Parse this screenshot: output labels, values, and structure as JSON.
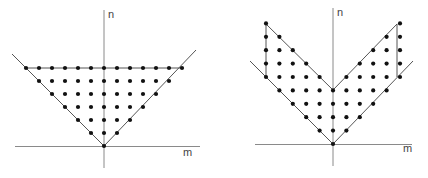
{
  "diagrams": [
    {
      "id": "left",
      "x_label": "m",
      "y_label": "n",
      "description": "lattice points with |m| <= n <= 6",
      "origin": [
        104,
        146
      ],
      "step": 13,
      "axis": {
        "h": [
          15,
          200
        ],
        "v": [
          10,
          168
        ]
      },
      "lines": [
        [
          [
            12,
            54
          ],
          [
            104,
            146
          ]
        ],
        [
          [
            104,
            146
          ],
          [
            196,
            50
          ]
        ],
        [
          [
            26,
            68
          ],
          [
            182,
            68
          ]
        ]
      ],
      "constraint": {
        "type": "triangle",
        "nmax": 6
      },
      "label_pos": {
        "n": [
          108,
          18
        ],
        "m": [
          183,
          156
        ]
      }
    },
    {
      "id": "right",
      "x_label": "m",
      "y_label": "n",
      "description": "lattice points with |m| <= n <= |m| + 4, -5 <= m <= 5",
      "origin": [
        333,
        144
      ],
      "step": 13.4,
      "axis": {
        "h": [
          255,
          412
        ],
        "v": [
          8,
          166
        ]
      },
      "lines": [
        [
          [
            250,
            61
          ],
          [
            333,
            144
          ]
        ],
        [
          [
            333,
            144
          ],
          [
            413,
            61
          ]
        ],
        [
          [
            266,
            24
          ],
          [
            333,
            90
          ]
        ],
        [
          [
            333,
            90
          ],
          [
            397,
            24
          ]
        ],
        [
          [
            266,
            24
          ],
          [
            266,
            77
          ]
        ],
        [
          [
            397,
            24
          ],
          [
            397,
            77
          ]
        ]
      ],
      "constraint": {
        "type": "band",
        "width": 4,
        "mmax": 5
      },
      "label_pos": {
        "n": [
          337,
          16
        ],
        "m": [
          403,
          152
        ]
      }
    }
  ]
}
